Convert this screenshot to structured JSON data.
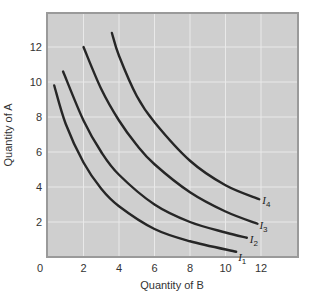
{
  "chart_data": {
    "type": "line",
    "title": "",
    "xlabel": "Quantity of B",
    "ylabel": "Quantity of A",
    "xlim": [
      0,
      14
    ],
    "ylim": [
      0,
      14
    ],
    "x_ticks": [
      0,
      2,
      4,
      6,
      8,
      10,
      12
    ],
    "y_ticks": [
      2,
      4,
      6,
      8,
      10,
      12
    ],
    "origin_label": "0",
    "grid": true,
    "legend": "inline labels at curve ends",
    "series": [
      {
        "name": "I1",
        "label_base": "I",
        "label_sub": "1",
        "points": [
          [
            0.35,
            9.8
          ],
          [
            1,
            7.6
          ],
          [
            2,
            5.4
          ],
          [
            3,
            3.9
          ],
          [
            4,
            2.9
          ],
          [
            6,
            1.6
          ],
          [
            8,
            0.9
          ],
          [
            10.6,
            0.3
          ]
        ]
      },
      {
        "name": "I2",
        "label_base": "I",
        "label_sub": "2",
        "points": [
          [
            0.85,
            10.6
          ],
          [
            2,
            7.8
          ],
          [
            3,
            6.0
          ],
          [
            4,
            4.7
          ],
          [
            6,
            3.0
          ],
          [
            8,
            2.0
          ],
          [
            10,
            1.4
          ],
          [
            11.2,
            1.1
          ]
        ]
      },
      {
        "name": "I3",
        "label_base": "I",
        "label_sub": "3",
        "points": [
          [
            2.0,
            12.0
          ],
          [
            3,
            9.6
          ],
          [
            4,
            7.8
          ],
          [
            5,
            6.4
          ],
          [
            6,
            5.3
          ],
          [
            8,
            3.7
          ],
          [
            10,
            2.6
          ],
          [
            11.8,
            1.9
          ]
        ]
      },
      {
        "name": "I4",
        "label_base": "I",
        "label_sub": "4",
        "points": [
          [
            3.6,
            12.8
          ],
          [
            4,
            11.5
          ],
          [
            5,
            9.2
          ],
          [
            6,
            7.7
          ],
          [
            8,
            5.5
          ],
          [
            10,
            4.1
          ],
          [
            11.9,
            3.3
          ]
        ]
      }
    ]
  },
  "style": {
    "plot_bg": "#cfcfcf",
    "grid_color": "#e9e9e9",
    "frame_color": "#9a9a9a",
    "curve_color": "#262626"
  }
}
